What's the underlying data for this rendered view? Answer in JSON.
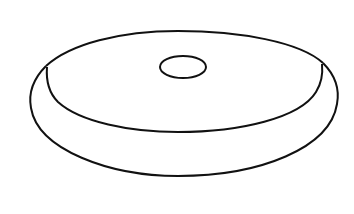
{
  "figure": {
    "description": "Line drawing of a flat disc/washer shape with a small central hole",
    "stroke_color": "#111111",
    "background": "#ffffff"
  }
}
